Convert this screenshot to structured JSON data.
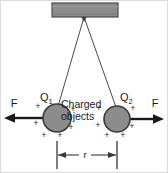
{
  "figure": {
    "support_bar": {
      "name": "support-bar",
      "fill": "#8c8c8c",
      "stroke": "#4a4a4a"
    },
    "threads": {
      "name": "suspension-threads",
      "stroke": "#4a4a4a",
      "pivot_x": 84,
      "pivot_y": 17
    },
    "charges": [
      {
        "id": "q1",
        "label": "Q",
        "subscript": "1",
        "cx": 57,
        "cy": 118,
        "r": 14,
        "fill": "#8c8c8c",
        "stroke": "#3a3a3a",
        "sign": "+"
      },
      {
        "id": "q2",
        "label": "Q",
        "subscript": "2",
        "cx": 117,
        "cy": 119,
        "r": 13,
        "fill": "#8c8c8c",
        "stroke": "#3a3a3a",
        "sign": "+"
      }
    ],
    "forces": [
      {
        "id": "force-left",
        "label": "F",
        "direction": "left",
        "label_x": 14,
        "label_y": 104,
        "arrow_y": 118
      },
      {
        "id": "force-right",
        "label": "F",
        "direction": "right",
        "label_x": 155,
        "label_y": 104,
        "arrow_y": 119
      }
    ],
    "callout": {
      "name": "charged-objects-label",
      "line1": "Charged",
      "line2": "objects",
      "x": 61,
      "y1": 106,
      "y2": 118
    },
    "dimension": {
      "name": "separation-distance",
      "label": "r",
      "label_x": 85,
      "label_y": 153,
      "y": 155,
      "x_left": 57,
      "x_right": 117,
      "tick_top": 140,
      "tick_bottom": 170,
      "stroke": "#3a3a3a"
    },
    "plus_signs": {
      "name": "surface-charge-marks",
      "symbol": "+",
      "q1": [
        {
          "x": 38,
          "y": 109
        },
        {
          "x": 36,
          "y": 126
        },
        {
          "x": 44,
          "y": 137
        },
        {
          "x": 60,
          "y": 136
        },
        {
          "x": 71,
          "y": 129
        },
        {
          "x": 73,
          "y": 112
        }
      ],
      "q2": [
        {
          "x": 99,
          "y": 111
        },
        {
          "x": 98,
          "y": 127
        },
        {
          "x": 107,
          "y": 137
        },
        {
          "x": 123,
          "y": 136
        },
        {
          "x": 132,
          "y": 128
        },
        {
          "x": 133,
          "y": 110
        }
      ]
    },
    "border": {
      "name": "figure-border",
      "stroke": "#d8d8d8"
    }
  }
}
